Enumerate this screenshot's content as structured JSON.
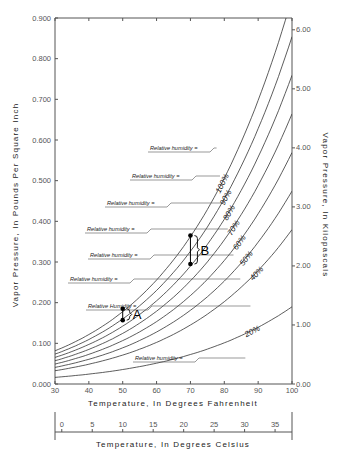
{
  "chart_data": {
    "type": "line",
    "title": "",
    "xlabel": "Temperature, In Degrees Fahrenheit",
    "xlabel_secondary": "Temperature, In Degrees Celsius",
    "ylabel": "Vapor Pressure, In Pounds Per Square Inch",
    "ylabel_secondary": "Vapor Pressure, In Kilopascals",
    "xlim": [
      30,
      100
    ],
    "ylim": [
      0,
      0.9
    ],
    "ylim_secondary": [
      0,
      6.2
    ],
    "x_ticks": [
      30,
      40,
      50,
      60,
      70,
      80,
      90,
      100
    ],
    "x_ticks_celsius": [
      0,
      5,
      10,
      15,
      20,
      25,
      30,
      35
    ],
    "y_ticks": [
      "0.000",
      "0.100",
      "0.200",
      "0.300",
      "0.400",
      "0.500",
      "0.600",
      "0.700",
      "0.800",
      "0.900"
    ],
    "y_ticks_secondary": [
      "0.00",
      "1.00",
      "2.00",
      "3.00",
      "4.00",
      "5.00",
      "6.00"
    ],
    "grid": false,
    "x": [
      30,
      40,
      50,
      60,
      70,
      80,
      90,
      100
    ],
    "saturation_psi": [
      0.0808,
      0.1217,
      0.1781,
      0.2563,
      0.3632,
      0.5073,
      0.6988,
      0.9503
    ],
    "series": [
      {
        "name": "100%",
        "rh": 1.0,
        "values": [
          0.081,
          0.122,
          0.178,
          0.256,
          0.363,
          0.507,
          0.699,
          0.95
        ]
      },
      {
        "name": "90%",
        "rh": 0.9,
        "values": [
          0.073,
          0.11,
          0.16,
          0.231,
          0.327,
          0.457,
          0.629,
          0.855
        ]
      },
      {
        "name": "80%",
        "rh": 0.8,
        "values": [
          0.065,
          0.097,
          0.142,
          0.205,
          0.291,
          0.406,
          0.559,
          0.76
        ]
      },
      {
        "name": "70%",
        "rh": 0.7,
        "values": [
          0.057,
          0.085,
          0.125,
          0.179,
          0.254,
          0.355,
          0.489,
          0.665
        ]
      },
      {
        "name": "60%",
        "rh": 0.6,
        "values": [
          0.048,
          0.073,
          0.107,
          0.154,
          0.218,
          0.304,
          0.419,
          0.57
        ]
      },
      {
        "name": "50%",
        "rh": 0.5,
        "values": [
          0.04,
          0.061,
          0.089,
          0.128,
          0.182,
          0.254,
          0.349,
          0.475
        ]
      },
      {
        "name": "40%",
        "rh": 0.4,
        "values": [
          0.032,
          0.049,
          0.071,
          0.103,
          0.145,
          0.203,
          0.28,
          0.38
        ]
      },
      {
        "name": "20%",
        "rh": 0.2,
        "values": [
          0.016,
          0.024,
          0.036,
          0.051,
          0.073,
          0.101,
          0.14,
          0.19
        ]
      }
    ],
    "annotations": [
      {
        "label": "A",
        "x": 50,
        "y_top": 0.185,
        "y_bottom": 0.157
      },
      {
        "label": "B",
        "x": 70,
        "y_top": 0.365,
        "y_bottom": 0.295
      }
    ],
    "rh_labels": [
      {
        "text": "Relative humidity =",
        "pct": "100%"
      },
      {
        "text": "Relative humidity =",
        "pct": "90%"
      },
      {
        "text": "Relative humidity =",
        "pct": "80%"
      },
      {
        "text": "Relative humidity =",
        "pct": "70%"
      },
      {
        "text": "Relative humidity =",
        "pct": "60%"
      },
      {
        "text": "Relative humidity =",
        "pct": "50%"
      },
      {
        "text": "Relative Humidity =",
        "pct": "40%"
      },
      {
        "text": "Relative humidity =",
        "pct": "20%"
      }
    ]
  }
}
